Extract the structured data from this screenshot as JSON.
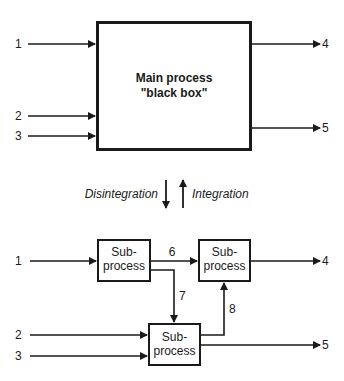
{
  "top": {
    "main_box": {
      "line1": "Main process",
      "line2": "\"black box\""
    },
    "inputs": [
      "1",
      "2",
      "3"
    ],
    "outputs": [
      "4",
      "5"
    ]
  },
  "transition": {
    "down_label": "Disintegration",
    "up_label": "Integration"
  },
  "bottom": {
    "boxes": [
      {
        "line1": "Sub-",
        "line2": "process"
      },
      {
        "line1": "Sub-",
        "line2": "process"
      },
      {
        "line1": "Sub-",
        "line2": "process"
      }
    ],
    "inputs": [
      "1",
      "2",
      "3"
    ],
    "outputs": [
      "4",
      "5"
    ],
    "internal_flows": [
      "6",
      "7",
      "8"
    ]
  },
  "colors": {
    "stroke": "#1a1a1a",
    "background": "#ffffff"
  }
}
